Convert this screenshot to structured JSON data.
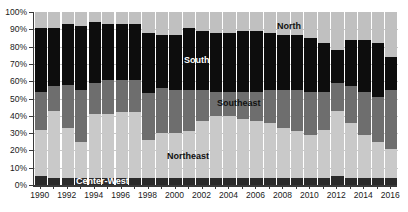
{
  "chart_data": {
    "type": "bar",
    "stacked": true,
    "normalized_percent": true,
    "title": "",
    "subtitle": "",
    "xlabel": "",
    "ylabel": "",
    "ylim": [
      0,
      100
    ],
    "grid": true,
    "legend_position": "inline-annotations",
    "categories": [
      "1990",
      "1991",
      "1992",
      "1993",
      "1994",
      "1995",
      "1996",
      "1997",
      "1998",
      "1999",
      "2000",
      "2001",
      "2002",
      "2003",
      "2004",
      "2005",
      "2006",
      "2007",
      "2008",
      "2009",
      "2010",
      "2011",
      "2012",
      "2013",
      "2014",
      "2015",
      "2016"
    ],
    "tick_labels_x": [
      "1990",
      "1992",
      "1994",
      "1996",
      "1998",
      "2000",
      "2002",
      "2004",
      "2006",
      "2008",
      "2010",
      "2012",
      "2014",
      "2016"
    ],
    "tick_labels_y": [
      "0%",
      "10%",
      "20%",
      "30%",
      "40%",
      "50%",
      "60%",
      "70%",
      "80%",
      "90%",
      "100%"
    ],
    "series": [
      {
        "name": "Center-West",
        "color": "#2b2b2b",
        "values": [
          5,
          4,
          4,
          4,
          4,
          4,
          4,
          4,
          4,
          4,
          4,
          4,
          4,
          4,
          4,
          4,
          4,
          4,
          4,
          4,
          4,
          4,
          5,
          4,
          4,
          4,
          4
        ]
      },
      {
        "name": "Northeast",
        "color": "#c9c9c9",
        "values": [
          27,
          39,
          29,
          21,
          37,
          37,
          38,
          38,
          22,
          26,
          26,
          27,
          33,
          36,
          36,
          34,
          33,
          32,
          29,
          27,
          25,
          28,
          38,
          32,
          25,
          21,
          17
        ]
      },
      {
        "name": "Southeast",
        "color": "#6e6e6e",
        "values": [
          22,
          14,
          25,
          30,
          18,
          20,
          19,
          19,
          27,
          26,
          25,
          24,
          18,
          14,
          14,
          16,
          17,
          19,
          22,
          24,
          25,
          22,
          16,
          21,
          25,
          26,
          34
        ]
      },
      {
        "name": "South",
        "color": "#0d0d0d",
        "values": [
          37,
          34,
          35,
          37,
          35,
          32,
          32,
          32,
          35,
          31,
          32,
          36,
          34,
          34,
          34,
          35,
          35,
          33,
          32,
          32,
          31,
          28,
          19,
          27,
          30,
          31,
          19
        ]
      },
      {
        "name": "North",
        "color": "#c0c0c0",
        "values": [
          9,
          9,
          7,
          8,
          6,
          7,
          7,
          7,
          12,
          13,
          13,
          9,
          11,
          12,
          12,
          11,
          11,
          12,
          13,
          13,
          15,
          18,
          22,
          16,
          16,
          18,
          26
        ]
      }
    ],
    "annotations": [
      {
        "text": "North",
        "style": "dark"
      },
      {
        "text": "South",
        "style": "light"
      },
      {
        "text": "Southeast",
        "style": "dark"
      },
      {
        "text": "Northeast",
        "style": "dark"
      },
      {
        "text": "Center-West",
        "style": "light"
      }
    ]
  }
}
